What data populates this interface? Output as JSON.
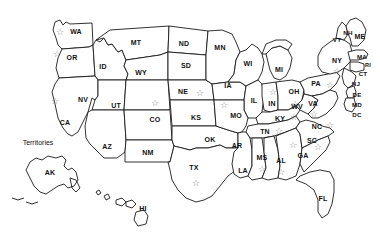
{
  "map": {
    "title": "United States map with state abbreviations and stars",
    "territories_label": "Territories",
    "star_glyph": "☆",
    "colors": {
      "background": "#ffffff",
      "state_fill": "#ffffff",
      "border": "#1a1a1a",
      "label_text": "#111111",
      "star": "#8a8a8a"
    },
    "states": [
      {
        "abbr": "WA",
        "x": 76,
        "y": 31,
        "size": "normal",
        "star": true,
        "star_x": 60,
        "star_y": 32
      },
      {
        "abbr": "OR",
        "x": 72,
        "y": 57,
        "size": "normal",
        "star": true,
        "star_x": 57,
        "star_y": 54
      },
      {
        "abbr": "ID",
        "x": 103,
        "y": 66,
        "size": "normal",
        "star": false,
        "star_x": null,
        "star_y": null
      },
      {
        "abbr": "MT",
        "x": 136,
        "y": 42,
        "size": "normal",
        "star": false,
        "star_x": null,
        "star_y": null
      },
      {
        "abbr": "WY",
        "x": 141,
        "y": 72,
        "size": "normal",
        "star": false,
        "star_x": null,
        "star_y": null
      },
      {
        "abbr": "ND",
        "x": 184,
        "y": 43,
        "size": "normal",
        "star": false,
        "star_x": null,
        "star_y": null
      },
      {
        "abbr": "SD",
        "x": 186,
        "y": 65,
        "size": "normal",
        "star": false,
        "star_x": null,
        "star_y": null
      },
      {
        "abbr": "NE",
        "x": 183,
        "y": 91,
        "size": "normal",
        "star": true,
        "star_x": 200,
        "star_y": 93
      },
      {
        "abbr": "MN",
        "x": 220,
        "y": 47,
        "size": "normal",
        "star": false,
        "star_x": null,
        "star_y": null
      },
      {
        "abbr": "IA",
        "x": 228,
        "y": 85,
        "size": "normal",
        "star": false,
        "star_x": null,
        "star_y": null
      },
      {
        "abbr": "WI",
        "x": 248,
        "y": 63,
        "size": "normal",
        "star": false,
        "star_x": null,
        "star_y": null
      },
      {
        "abbr": "MI",
        "x": 279,
        "y": 69,
        "size": "normal",
        "star": false,
        "star_x": null,
        "star_y": null
      },
      {
        "abbr": "IL",
        "x": 254,
        "y": 100,
        "size": "normal",
        "star": false,
        "star_x": null,
        "star_y": null
      },
      {
        "abbr": "IN",
        "x": 272,
        "y": 103,
        "size": "normal",
        "star": true,
        "star_x": 273,
        "star_y": 92
      },
      {
        "abbr": "OH",
        "x": 294,
        "y": 91,
        "size": "normal",
        "star": true,
        "star_x": 295,
        "star_y": 104
      },
      {
        "abbr": "MO",
        "x": 236,
        "y": 115,
        "size": "normal",
        "star": true,
        "star_x": 224,
        "star_y": 105
      },
      {
        "abbr": "KS",
        "x": 196,
        "y": 117,
        "size": "normal",
        "star": false,
        "star_x": null,
        "star_y": null
      },
      {
        "abbr": "OK",
        "x": 210,
        "y": 139,
        "size": "normal",
        "star": false,
        "star_x": null,
        "star_y": null
      },
      {
        "abbr": "AR",
        "x": 237,
        "y": 145,
        "size": "normal",
        "star": false,
        "star_x": null,
        "star_y": null
      },
      {
        "abbr": "TX",
        "x": 194,
        "y": 167,
        "size": "normal",
        "star": true,
        "star_x": 196,
        "star_y": 183
      },
      {
        "abbr": "LA",
        "x": 243,
        "y": 170,
        "size": "normal",
        "star": false,
        "star_x": null,
        "star_y": null
      },
      {
        "abbr": "MS",
        "x": 262,
        "y": 157,
        "size": "normal",
        "star": true,
        "star_x": 262,
        "star_y": 169
      },
      {
        "abbr": "AL",
        "x": 281,
        "y": 160,
        "size": "normal",
        "star": true,
        "star_x": 281,
        "star_y": 172
      },
      {
        "abbr": "GA",
        "x": 303,
        "y": 155,
        "size": "normal",
        "star": true,
        "star_x": 293,
        "star_y": 145
      },
      {
        "abbr": "FL",
        "x": 323,
        "y": 198,
        "size": "normal",
        "star": false,
        "star_x": null,
        "star_y": null
      },
      {
        "abbr": "TN",
        "x": 265,
        "y": 131,
        "size": "normal",
        "star": true,
        "star_x": 279,
        "star_y": 131
      },
      {
        "abbr": "KY",
        "x": 280,
        "y": 118,
        "size": "normal",
        "star": true,
        "star_x": 294,
        "star_y": 117
      },
      {
        "abbr": "SC",
        "x": 312,
        "y": 140,
        "size": "normal",
        "star": true,
        "star_x": 318,
        "star_y": 147
      },
      {
        "abbr": "NC",
        "x": 317,
        "y": 126,
        "size": "normal",
        "star": true,
        "star_x": 330,
        "star_y": 125
      },
      {
        "abbr": "VA",
        "x": 313,
        "y": 103,
        "size": "normal",
        "star": true,
        "star_x": 314,
        "star_y": 114
      },
      {
        "abbr": "WV",
        "x": 297,
        "y": 106,
        "size": "normal",
        "star": false,
        "star_x": null,
        "star_y": null
      },
      {
        "abbr": "PA",
        "x": 316,
        "y": 83,
        "size": "normal",
        "star": true,
        "star_x": 330,
        "star_y": 85
      },
      {
        "abbr": "NY",
        "x": 337,
        "y": 60,
        "size": "normal",
        "star": true,
        "star_x": 337,
        "star_y": 71
      },
      {
        "abbr": "VT",
        "x": 337,
        "y": 39,
        "size": "small",
        "star": false,
        "star_x": null,
        "star_y": null
      },
      {
        "abbr": "NH",
        "x": 348,
        "y": 32,
        "size": "small",
        "star": false,
        "star_x": null,
        "star_y": null
      },
      {
        "abbr": "ME",
        "x": 360,
        "y": 36,
        "size": "normal",
        "star": false,
        "star_x": null,
        "star_y": null
      },
      {
        "abbr": "MA",
        "x": 362,
        "y": 56,
        "size": "small",
        "star": false,
        "star_x": null,
        "star_y": null
      },
      {
        "abbr": "RI",
        "x": 368,
        "y": 65,
        "size": "tiny",
        "star": false,
        "star_x": null,
        "star_y": null
      },
      {
        "abbr": "CT",
        "x": 363,
        "y": 73,
        "size": "small",
        "star": false,
        "star_x": null,
        "star_y": null
      },
      {
        "abbr": "NJ",
        "x": 356,
        "y": 83,
        "size": "small",
        "star": false,
        "star_x": null,
        "star_y": null
      },
      {
        "abbr": "DE",
        "x": 357,
        "y": 94,
        "size": "small",
        "star": false,
        "star_x": null,
        "star_y": null
      },
      {
        "abbr": "MD",
        "x": 357,
        "y": 104,
        "size": "small",
        "star": false,
        "star_x": null,
        "star_y": null
      },
      {
        "abbr": "DC",
        "x": 357,
        "y": 114,
        "size": "small",
        "star": false,
        "star_x": null,
        "star_y": null
      },
      {
        "abbr": "NV",
        "x": 83,
        "y": 99,
        "size": "normal",
        "star": false,
        "star_x": null,
        "star_y": null
      },
      {
        "abbr": "CA",
        "x": 65,
        "y": 122,
        "size": "normal",
        "star": true,
        "star_x": 55,
        "star_y": 101
      },
      {
        "abbr": "UT",
        "x": 116,
        "y": 105,
        "size": "normal",
        "star": false,
        "star_x": null,
        "star_y": null
      },
      {
        "abbr": "CO",
        "x": 155,
        "y": 119,
        "size": "normal",
        "star": true,
        "star_x": 155,
        "star_y": 103
      },
      {
        "abbr": "AZ",
        "x": 107,
        "y": 146,
        "size": "normal",
        "star": false,
        "star_x": null,
        "star_y": null
      },
      {
        "abbr": "NM",
        "x": 148,
        "y": 152,
        "size": "normal",
        "star": false,
        "star_x": null,
        "star_y": null
      },
      {
        "abbr": "AK",
        "x": 50,
        "y": 172,
        "size": "normal",
        "star": false,
        "star_x": null,
        "star_y": null
      },
      {
        "abbr": "HI",
        "x": 143,
        "y": 208,
        "size": "normal",
        "star": false,
        "star_x": null,
        "star_y": null
      }
    ]
  }
}
